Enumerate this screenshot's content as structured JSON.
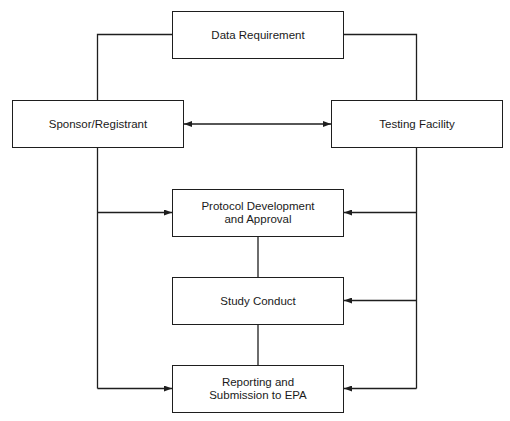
{
  "diagram": {
    "title": "",
    "colors": {
      "line": "#1e1e1e",
      "text": "#1a1a1a",
      "background": "#ffffff"
    },
    "nodes": [
      {
        "id": "data-requirement",
        "label": "Data Requirement",
        "x": 172,
        "y": 11,
        "w": 172,
        "h": 48
      },
      {
        "id": "sponsor-registrant",
        "label": "Sponsor/Registrant",
        "x": 12,
        "y": 100,
        "w": 172,
        "h": 48
      },
      {
        "id": "testing-facility",
        "label": "Testing Facility",
        "x": 331,
        "y": 100,
        "w": 172,
        "h": 48
      },
      {
        "id": "protocol-development",
        "label": "Protocol Development\nand Approval",
        "x": 172,
        "y": 189,
        "w": 172,
        "h": 48
      },
      {
        "id": "study-conduct",
        "label": "Study Conduct",
        "x": 172,
        "y": 277,
        "w": 172,
        "h": 48
      },
      {
        "id": "reporting-submission",
        "label": "Reporting and\nSubmission to EPA",
        "x": 172,
        "y": 365,
        "w": 172,
        "h": 48
      }
    ],
    "edges": [
      {
        "from": "data-requirement",
        "to": "sponsor-registrant",
        "type": "line"
      },
      {
        "from": "data-requirement",
        "to": "testing-facility",
        "type": "line"
      },
      {
        "from": "sponsor-registrant",
        "to": "testing-facility",
        "type": "bidirectional-arrow"
      },
      {
        "from": "sponsor-registrant",
        "to": "protocol-development",
        "type": "arrow"
      },
      {
        "from": "sponsor-registrant",
        "to": "reporting-submission",
        "type": "arrow"
      },
      {
        "from": "testing-facility",
        "to": "protocol-development",
        "type": "arrow"
      },
      {
        "from": "testing-facility",
        "to": "study-conduct",
        "type": "arrow"
      },
      {
        "from": "testing-facility",
        "to": "reporting-submission",
        "type": "arrow"
      },
      {
        "from": "protocol-development",
        "to": "study-conduct",
        "type": "line"
      },
      {
        "from": "study-conduct",
        "to": "reporting-submission",
        "type": "line"
      }
    ]
  }
}
